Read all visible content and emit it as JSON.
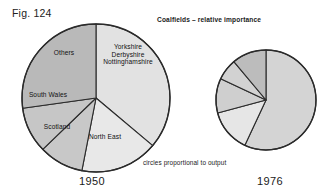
{
  "figure": {
    "number_label": "Fig. 124",
    "title": "Coalfields – relative importance",
    "note": "circles proportional to output"
  },
  "pies": {
    "left": {
      "year_label": "1950",
      "labels": {
        "others": "Others",
        "ydn_line1": "Yorkshire",
        "ydn_line2": "Derbyshire",
        "ydn_line3": "Nottinghamshire",
        "south_wales": "South Wales",
        "scotland": "Scotland",
        "north_east": "North East"
      }
    },
    "right": {
      "year_label": "1976"
    }
  },
  "chart_data": {
    "type": "pie",
    "title": "Coalfields – relative importance",
    "subtitle": "circles proportional to output",
    "figure_number": "Fig. 124",
    "note": "circles proportional to output",
    "legend": "none (slices labelled in place)",
    "grid": false,
    "radius_note": "circle areas proportional to total coal output; 1950 radius 74px, 1976 radius 50px",
    "charts": [
      {
        "name": "1950",
        "year": "1950",
        "center_px": [
          96,
          98
        ],
        "radius_px": 74,
        "start_angle_deg": 0,
        "direction": "clockwise",
        "categories": [
          "Yorkshire Derbyshire Nottinghamshire",
          "North East",
          "Scotland",
          "South Wales",
          "Others"
        ],
        "values_percent": [
          36,
          17,
          10,
          10,
          27
        ],
        "angles_deg": [
          130,
          61,
          35,
          36,
          98
        ],
        "colors": [
          "#e2e2e2",
          "#e8e8e8",
          "#c8c8c8",
          "#c6c6c6",
          "#b9b9b9"
        ],
        "labels_shown": [
          "Yorkshire Derbyshire Nottinghamshire",
          "North East",
          "Scotland",
          "South Wales",
          "Others"
        ]
      },
      {
        "name": "1976",
        "year": "1976",
        "center_px": [
          266,
          100
        ],
        "radius_px": 50,
        "start_angle_deg": 0,
        "direction": "clockwise",
        "categories": [
          "Yorkshire Derbyshire Nottinghamshire",
          "North East",
          "Scotland",
          "South Wales",
          "Others"
        ],
        "values_percent": [
          57,
          14,
          11,
          7,
          11
        ],
        "angles_deg": [
          205,
          50,
          40,
          25,
          40
        ],
        "colors": [
          "#d4d4d4",
          "#e6e6e6",
          "#cfcfcf",
          "#d2d2d2",
          "#bcbcbc"
        ],
        "labels_shown": []
      }
    ]
  }
}
